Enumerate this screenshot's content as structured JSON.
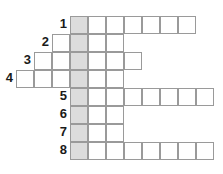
{
  "puzzle": {
    "type": "crossword-keyword",
    "cell_size": 18,
    "origin_x": 70,
    "origin_y": 16,
    "shaded_column": 0,
    "colors": {
      "border": "#9a9a9a",
      "shaded": "#dcdcdc",
      "blank": "#ffffff",
      "number": "#1a1a1a"
    },
    "rows": [
      {
        "number": "1",
        "start_col": 0,
        "end_col": 6
      },
      {
        "number": "2",
        "start_col": -1,
        "end_col": 2
      },
      {
        "number": "3",
        "start_col": -2,
        "end_col": 3
      },
      {
        "number": "4",
        "start_col": -3,
        "end_col": 2
      },
      {
        "number": "5",
        "start_col": 0,
        "end_col": 7
      },
      {
        "number": "6",
        "start_col": 0,
        "end_col": 2
      },
      {
        "number": "7",
        "start_col": 0,
        "end_col": 2
      },
      {
        "number": "8",
        "start_col": 0,
        "end_col": 7
      }
    ]
  }
}
